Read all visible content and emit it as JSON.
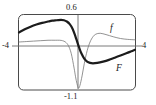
{
  "figure": {
    "kind": "function-plot",
    "background_color": "#ffffff",
    "frame_color": "#4a4a4a",
    "axis_color": "#6b6b6b"
  },
  "labels": {
    "top": "0.6",
    "bottom": "-1.1",
    "left": "-4",
    "right": "4",
    "curve_f": "f",
    "curve_F": "F"
  },
  "chart_data": {
    "type": "line",
    "title": "",
    "xlabel": "",
    "ylabel": "",
    "xlim": [
      -4,
      4
    ],
    "ylim": [
      -1.1,
      0.6
    ],
    "grid": false,
    "legend": "inline-curve-labels",
    "x_tick_labels": [
      "-4",
      "4"
    ],
    "y_tick_labels": [
      "0.6",
      "-1.1"
    ],
    "axis_crossing": {
      "x": 0,
      "y": 0
    },
    "annotations": [
      {
        "text": "0.6",
        "position": "top-center",
        "meaning": "upper y bound"
      },
      {
        "text": "-1.1",
        "position": "bottom-center",
        "meaning": "lower y bound"
      },
      {
        "text": "-4",
        "position": "left-axis",
        "meaning": "left x bound"
      },
      {
        "text": "4",
        "position": "right-axis",
        "meaning": "right x bound"
      },
      {
        "text": "f",
        "position": "upper-right",
        "meaning": "thin curve label"
      },
      {
        "text": "F",
        "position": "lower-right",
        "meaning": "thick curve label"
      }
    ],
    "series": [
      {
        "name": "f",
        "style": "thin",
        "color": "#777777",
        "line_width": 0.8,
        "x": [
          -4.0,
          -3.5,
          -3.0,
          -2.5,
          -2.0,
          -1.5,
          -1.2,
          -1.0,
          -0.8,
          -0.6,
          -0.4,
          -0.2,
          -0.1,
          0.0,
          0.1,
          0.2,
          0.35,
          0.5,
          0.7,
          0.9,
          1.1,
          1.3,
          1.6,
          2.0,
          2.5,
          3.0,
          3.5,
          4.0
        ],
        "y": [
          -0.02,
          -0.01,
          0.0,
          0.01,
          0.02,
          0.02,
          0.02,
          0.01,
          -0.02,
          -0.1,
          -0.28,
          -0.62,
          -0.82,
          -0.98,
          -1.08,
          -1.02,
          -0.8,
          -0.52,
          -0.22,
          -0.02,
          0.1,
          0.16,
          0.18,
          0.15,
          0.1,
          0.06,
          0.04,
          0.03
        ]
      },
      {
        "name": "F",
        "style": "thick",
        "color": "#1c1c1c",
        "line_width": 2.2,
        "x": [
          -4.0,
          -3.6,
          -3.2,
          -2.8,
          -2.4,
          -2.0,
          -1.7,
          -1.4,
          -1.1,
          -0.9,
          -0.7,
          -0.5,
          -0.3,
          -0.1,
          0.0,
          0.15,
          0.3,
          0.5,
          0.7,
          0.9,
          1.1,
          1.4,
          1.8,
          2.2,
          2.6,
          3.0,
          3.4,
          3.7,
          4.0
        ],
        "y": [
          0.2,
          0.27,
          0.33,
          0.38,
          0.42,
          0.45,
          0.47,
          0.48,
          0.49,
          0.48,
          0.45,
          0.39,
          0.28,
          0.1,
          0.0,
          -0.15,
          -0.28,
          -0.4,
          -0.47,
          -0.5,
          -0.51,
          -0.5,
          -0.47,
          -0.43,
          -0.38,
          -0.33,
          -0.28,
          -0.24,
          -0.2
        ]
      }
    ]
  }
}
